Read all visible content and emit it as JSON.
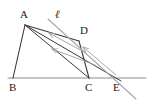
{
  "figure": {
    "type": "geometry-diagram",
    "title": "",
    "canvas": {
      "width": 152,
      "height": 104
    },
    "colors": {
      "stroke_dark": "#3a3a3a",
      "stroke_light": "#a8a8a8",
      "stroke_baseline": "#8c8c8c",
      "label": "#1a1a1a",
      "background": "#ffffff"
    },
    "points": [
      {
        "id": "A",
        "label": "A",
        "x": 25,
        "y": 25,
        "label_x": 20,
        "label_y": 9,
        "style": "roman"
      },
      {
        "id": "B",
        "label": "B",
        "x": 13,
        "y": 78,
        "label_x": 9,
        "label_y": 82,
        "style": "roman"
      },
      {
        "id": "C",
        "label": "C",
        "x": 89,
        "y": 78,
        "label_x": 85,
        "label_y": 82,
        "style": "roman"
      },
      {
        "id": "D",
        "label": "D",
        "x": 79,
        "y": 41,
        "label_x": 80,
        "label_y": 25,
        "style": "roman"
      },
      {
        "id": "E",
        "label": "E",
        "x": 117,
        "y": 78,
        "label_x": 113,
        "label_y": 82,
        "style": "roman"
      }
    ],
    "line_label": {
      "id": "ell",
      "label": "ℓ",
      "label_x": 55,
      "label_y": 9,
      "style": "italic"
    },
    "segments": [
      {
        "name": "baseline-BE-extended",
        "x1": 8,
        "y1": 78,
        "x2": 146,
        "y2": 78,
        "shade": "baseline",
        "width": 1.0
      },
      {
        "name": "side-AB",
        "x1": 25,
        "y1": 25,
        "x2": 13,
        "y2": 78,
        "shade": "dark",
        "width": 1.1
      },
      {
        "name": "side-DC",
        "x1": 79,
        "y1": 41,
        "x2": 89,
        "y2": 78,
        "shade": "dark",
        "width": 1.1
      },
      {
        "name": "diag-AD",
        "x1": 25,
        "y1": 25,
        "x2": 79,
        "y2": 41,
        "shade": "dark",
        "width": 1.1
      },
      {
        "name": "diag-AC",
        "x1": 25,
        "y1": 25,
        "x2": 89,
        "y2": 78,
        "shade": "dark",
        "width": 1.0
      },
      {
        "name": "diag-AE",
        "x1": 25,
        "y1": 25,
        "x2": 121,
        "y2": 81,
        "shade": "dark",
        "width": 1.0
      },
      {
        "name": "line-ell",
        "x1": 48,
        "y1": 19,
        "x2": 136,
        "y2": 99,
        "shade": "light",
        "width": 1.1
      }
    ],
    "arrows": [
      {
        "name": "arrow-to-A-upper",
        "x1": 86,
        "y1": 53,
        "x2": 49,
        "y2": 33,
        "shade": "light",
        "width": 1.0
      },
      {
        "name": "arrow-to-A-lower",
        "x1": 95,
        "y1": 65,
        "x2": 52,
        "y2": 49,
        "shade": "light",
        "width": 1.0
      },
      {
        "name": "arrow-E-to-D",
        "x1": 116,
        "y1": 75,
        "x2": 83,
        "y2": 47,
        "shade": "light",
        "width": 1.0
      }
    ]
  }
}
